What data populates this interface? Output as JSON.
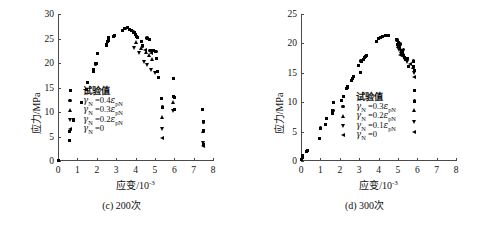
{
  "figure": {
    "panels": [
      {
        "id": "c",
        "caption": "(c) 200次",
        "xlabel_main": "应变/10",
        "xlabel_exp": "-3",
        "ylabel": "应力/MPa",
        "legend": [
          {
            "marker": "square",
            "label": "试验值",
            "raw": "试验值"
          },
          {
            "marker": "circle",
            "label": "γN =0.4εpN",
            "gamma": "γ",
            "gsub": "N",
            "eq": " =0.4",
            "eps": "ε",
            "esub": "pN"
          },
          {
            "marker": "triangle-up",
            "label": "γN =0.3εpN",
            "gamma": "γ",
            "gsub": "N",
            "eq": " =0.3",
            "eps": "ε",
            "esub": "pN"
          },
          {
            "marker": "triangle-down",
            "label": "γN =0.2εpN",
            "gamma": "γ",
            "gsub": "N",
            "eq": " =0.2",
            "eps": "ε",
            "esub": "pN"
          },
          {
            "marker": "triangle-left",
            "label": "γN =0",
            "gamma": "γ",
            "gsub": "N",
            "eq": " =0",
            "eps": "",
            "esub": ""
          }
        ],
        "chart_data": {
          "type": "scatter",
          "title": "(c) 200次",
          "xlabel": "应变/10-3",
          "ylabel": "应力/MPa",
          "xlim": [
            0,
            8
          ],
          "ylim": [
            0,
            30
          ],
          "xticks": [
            0,
            1,
            2,
            3,
            4,
            5,
            6,
            7,
            8
          ],
          "yticks": [
            0,
            5,
            10,
            15,
            20,
            25,
            30
          ],
          "grid": false,
          "legend_position": "center-left",
          "series": [
            {
              "name": "试验值",
              "marker": "square",
              "points": [
                [
                  0.02,
                  0.2
                ],
                [
                  0.6,
                  4.1
                ],
                [
                  0.6,
                  6.0
                ],
                [
                  0.78,
                  8.2
                ],
                [
                  0.82,
                  8.4
                ],
                [
                  1.2,
                  12.0
                ],
                [
                  1.45,
                  14.6
                ],
                [
                  1.5,
                  16.0
                ],
                [
                  1.82,
                  18.3
                ],
                [
                  1.85,
                  18.6
                ],
                [
                  1.95,
                  19.8
                ],
                [
                  2.0,
                  19.9
                ],
                [
                  2.02,
                  22.0
                ],
                [
                  2.48,
                  23.5
                ],
                [
                  2.5,
                  23.8
                ],
                [
                  2.55,
                  24.3
                ],
                [
                  2.6,
                  24.5
                ],
                [
                  2.62,
                  25.2
                ],
                [
                  2.85,
                  25.4
                ],
                [
                  2.9,
                  25.6
                ],
                [
                  3.35,
                  26.7
                ],
                [
                  3.45,
                  27.1
                ],
                [
                  3.6,
                  27.2
                ],
                [
                  3.7,
                  26.9
                ],
                [
                  3.78,
                  26.6
                ],
                [
                  3.9,
                  26.3
                ],
                [
                  3.95,
                  26.2
                ],
                [
                  4.0,
                  25.9
                ],
                [
                  4.05,
                  25.5
                ],
                [
                  4.1,
                  25.2
                ],
                [
                  4.3,
                  24.4
                ],
                [
                  4.35,
                  23.5
                ],
                [
                  4.6,
                  25.1
                ],
                [
                  4.7,
                  24.8
                ],
                [
                  4.75,
                  22.5
                ],
                [
                  4.95,
                  22.6
                ],
                [
                  5.05,
                  22.4
                ],
                [
                  5.1,
                  21.0
                ],
                [
                  5.15,
                  18.2
                ],
                [
                  5.2,
                  17.0
                ],
                [
                  5.35,
                  12.8
                ],
                [
                  5.4,
                  11.0
                ],
                [
                  5.95,
                  16.9
                ],
                [
                  5.95,
                  13.2
                ],
                [
                  6.0,
                  13.0
                ],
                [
                  6.0,
                  10.5
                ],
                [
                  7.45,
                  10.5
                ],
                [
                  7.5,
                  8.0
                ],
                [
                  7.5,
                  6.2
                ],
                [
                  7.5,
                  3.4
                ]
              ]
            },
            {
              "name": "γN =0.4εpN",
              "marker": "circle",
              "points": [
                [
                  0.6,
                  6.0
                ],
                [
                  1.2,
                  12.0
                ],
                [
                  1.95,
                  19.8
                ],
                [
                  2.5,
                  23.8
                ],
                [
                  2.9,
                  25.6
                ],
                [
                  3.45,
                  27.1
                ],
                [
                  3.9,
                  26.3
                ],
                [
                  4.1,
                  25.2
                ],
                [
                  4.35,
                  23.5
                ],
                [
                  4.6,
                  25.1
                ],
                [
                  4.75,
                  22.5
                ],
                [
                  5.05,
                  22.4
                ],
                [
                  5.4,
                  11.0
                ],
                [
                  5.95,
                  16.9
                ],
                [
                  6.0,
                  13.0
                ],
                [
                  7.5,
                  8.0
                ]
              ]
            },
            {
              "name": "γN =0.3εpN",
              "marker": "triangle-up",
              "points": [
                [
                  4.05,
                  24.2
                ],
                [
                  4.3,
                  23.1
                ],
                [
                  4.55,
                  22.2
                ],
                [
                  4.7,
                  21.6
                ],
                [
                  4.85,
                  20.9
                ],
                [
                  5.38,
                  9.0
                ],
                [
                  5.95,
                  12.0
                ],
                [
                  7.5,
                  6.2
                ]
              ]
            },
            {
              "name": "γN =0.2εpN",
              "marker": "triangle-down",
              "points": [
                [
                  3.95,
                  23.0
                ],
                [
                  4.2,
                  22.0
                ],
                [
                  4.45,
                  20.3
                ],
                [
                  4.6,
                  19.6
                ],
                [
                  4.8,
                  18.6
                ],
                [
                  5.0,
                  18.0
                ],
                [
                  5.38,
                  6.6
                ],
                [
                  5.95,
                  10.2
                ],
                [
                  7.5,
                  3.6
                ]
              ]
            },
            {
              "name": "γN =0",
              "marker": "triangle-left",
              "points": [
                [
                  4.5,
                  22.6
                ],
                [
                  4.82,
                  21.9
                ],
                [
                  5.38,
                  4.6
                ],
                [
                  7.5,
                  3.0
                ]
              ]
            }
          ]
        }
      },
      {
        "id": "d",
        "caption": "(d) 300次",
        "xlabel_main": "应变/10",
        "xlabel_exp": "-3",
        "ylabel": "应力/MPa",
        "legend": [
          {
            "marker": "square",
            "label": "试验值",
            "raw": "试验值"
          },
          {
            "marker": "circle",
            "label": "γN =0.3εpN",
            "gamma": "γ",
            "gsub": "N",
            "eq": " =0.3",
            "eps": "ε",
            "esub": "pN"
          },
          {
            "marker": "triangle-up",
            "label": "γN =0.2εpN",
            "gamma": "γ",
            "gsub": "N",
            "eq": " =0.2",
            "eps": "ε",
            "esub": "pN"
          },
          {
            "marker": "triangle-down",
            "label": "γN =0.1εpN",
            "gamma": "γ",
            "gsub": "N",
            "eq": " =0.1",
            "eps": "ε",
            "esub": "pN"
          },
          {
            "marker": "triangle-left",
            "label": "γN =0",
            "gamma": "γ",
            "gsub": "N",
            "eq": " =0",
            "eps": "",
            "esub": ""
          }
        ],
        "chart_data": {
          "type": "scatter",
          "title": "(d) 300次",
          "xlabel": "应变/10-3",
          "ylabel": "应力/MPa",
          "xlim": [
            0,
            8
          ],
          "ylim": [
            0,
            25
          ],
          "xticks": [
            0,
            1,
            2,
            3,
            4,
            5,
            6,
            7,
            8
          ],
          "yticks": [
            0,
            5,
            10,
            15,
            20,
            25
          ],
          "grid": false,
          "legend_position": "center",
          "series": [
            {
              "name": "试验值",
              "marker": "square",
              "points": [
                [
                  0.05,
                  0.3
                ],
                [
                  0.08,
                  0.6
                ],
                [
                  0.1,
                  0.9
                ],
                [
                  0.3,
                  1.7
                ],
                [
                  0.32,
                  1.8
                ],
                [
                  0.95,
                  3.9
                ],
                [
                  1.0,
                  5.6
                ],
                [
                  1.25,
                  6.2
                ],
                [
                  1.3,
                  7.2
                ],
                [
                  1.6,
                  8.0
                ],
                [
                  1.62,
                  8.3
                ],
                [
                  1.65,
                  8.6
                ],
                [
                  1.68,
                  9.9
                ],
                [
                  2.1,
                  10.3
                ],
                [
                  2.35,
                  12.3
                ],
                [
                  2.4,
                  12.5
                ],
                [
                  2.42,
                  12.7
                ],
                [
                  2.6,
                  13.7
                ],
                [
                  2.65,
                  14.1
                ],
                [
                  2.7,
                  14.3
                ],
                [
                  2.95,
                  16.2
                ],
                [
                  3.05,
                  15.1
                ],
                [
                  3.1,
                  17.0
                ],
                [
                  3.25,
                  17.3
                ],
                [
                  3.3,
                  17.6
                ],
                [
                  3.35,
                  17.7
                ],
                [
                  3.4,
                  18.0
                ],
                [
                  3.9,
                  20.3
                ],
                [
                  4.0,
                  20.8
                ],
                [
                  4.1,
                  21.0
                ],
                [
                  4.2,
                  21.2
                ],
                [
                  4.35,
                  21.3
                ],
                [
                  4.5,
                  21.3
                ],
                [
                  4.95,
                  20.6
                ],
                [
                  5.0,
                  19.8
                ],
                [
                  5.05,
                  20.2
                ],
                [
                  5.1,
                  19.4
                ],
                [
                  5.2,
                  18.8
                ],
                [
                  5.25,
                  18.5
                ],
                [
                  5.3,
                  18.0
                ],
                [
                  5.35,
                  17.6
                ],
                [
                  5.4,
                  17.2
                ],
                [
                  5.5,
                  17.4
                ],
                [
                  5.55,
                  16.0
                ],
                [
                  5.8,
                  17.0
                ],
                [
                  5.82,
                  16.0
                ],
                [
                  5.85,
                  15.4
                ],
                [
                  5.85,
                  12.0
                ],
                [
                  5.85,
                  10.2
                ]
              ]
            },
            {
              "name": "γN =0.3εpN",
              "marker": "circle",
              "points": [
                [
                  1.0,
                  5.6
                ],
                [
                  1.65,
                  8.6
                ],
                [
                  2.4,
                  12.5
                ],
                [
                  3.1,
                  17.0
                ],
                [
                  4.0,
                  20.8
                ],
                [
                  4.95,
                  20.6
                ],
                [
                  5.15,
                  19.9
                ],
                [
                  5.3,
                  19.0
                ],
                [
                  5.5,
                  17.4
                ],
                [
                  5.8,
                  17.0
                ],
                [
                  5.85,
                  12.0
                ],
                [
                  5.85,
                  10.2
                ]
              ]
            },
            {
              "name": "γN =0.2εpN",
              "marker": "triangle-up",
              "points": [
                [
                  5.0,
                  19.6
                ],
                [
                  5.15,
                  19.2
                ],
                [
                  5.3,
                  18.4
                ],
                [
                  5.45,
                  17.4
                ],
                [
                  5.82,
                  16.0
                ],
                [
                  5.85,
                  8.7
                ]
              ]
            },
            {
              "name": "γN =0.1εpN",
              "marker": "triangle-down",
              "points": [
                [
                  5.05,
                  18.8
                ],
                [
                  5.2,
                  18.2
                ],
                [
                  5.35,
                  17.6
                ],
                [
                  5.5,
                  16.8
                ],
                [
                  5.85,
                  15.0
                ],
                [
                  5.85,
                  6.6
                ]
              ]
            },
            {
              "name": "γN =0",
              "marker": "triangle-left",
              "points": [
                [
                  5.1,
                  18.0
                ],
                [
                  5.6,
                  16.4
                ],
                [
                  5.85,
                  14.2
                ],
                [
                  5.85,
                  4.9
                ]
              ]
            }
          ]
        }
      }
    ]
  }
}
